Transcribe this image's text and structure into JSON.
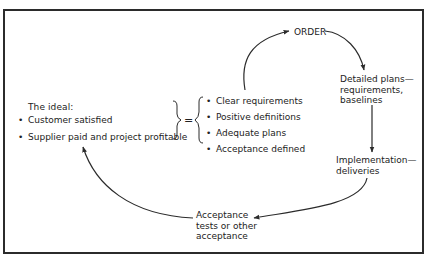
{
  "diagram": {
    "ideal": {
      "heading": "The ideal:",
      "items": [
        "Customer satisfied",
        "Supplier paid and project profitable"
      ]
    },
    "equals_symbol": "=",
    "prerequisites": {
      "items": [
        "Clear requirements",
        "Positive definitions",
        "Adequate plans",
        "Acceptance defined"
      ]
    },
    "cycle_nodes": {
      "order": "ORDER",
      "detailed_plans": "Detailed plans—\nrequirements,\nbaselines",
      "implementation": "Implementation—\ndeliveries",
      "acceptance": "Acceptance\ntests or other\nacceptance"
    },
    "arrows": [
      {
        "from": "prerequisites",
        "to": "order"
      },
      {
        "from": "order",
        "to": "detailed_plans"
      },
      {
        "from": "detailed_plans",
        "to": "implementation"
      },
      {
        "from": "implementation",
        "to": "acceptance"
      },
      {
        "from": "acceptance",
        "to": "ideal"
      }
    ],
    "colors": {
      "line": "#2b2b2b",
      "text": "#222222",
      "background": "#ffffff"
    }
  }
}
